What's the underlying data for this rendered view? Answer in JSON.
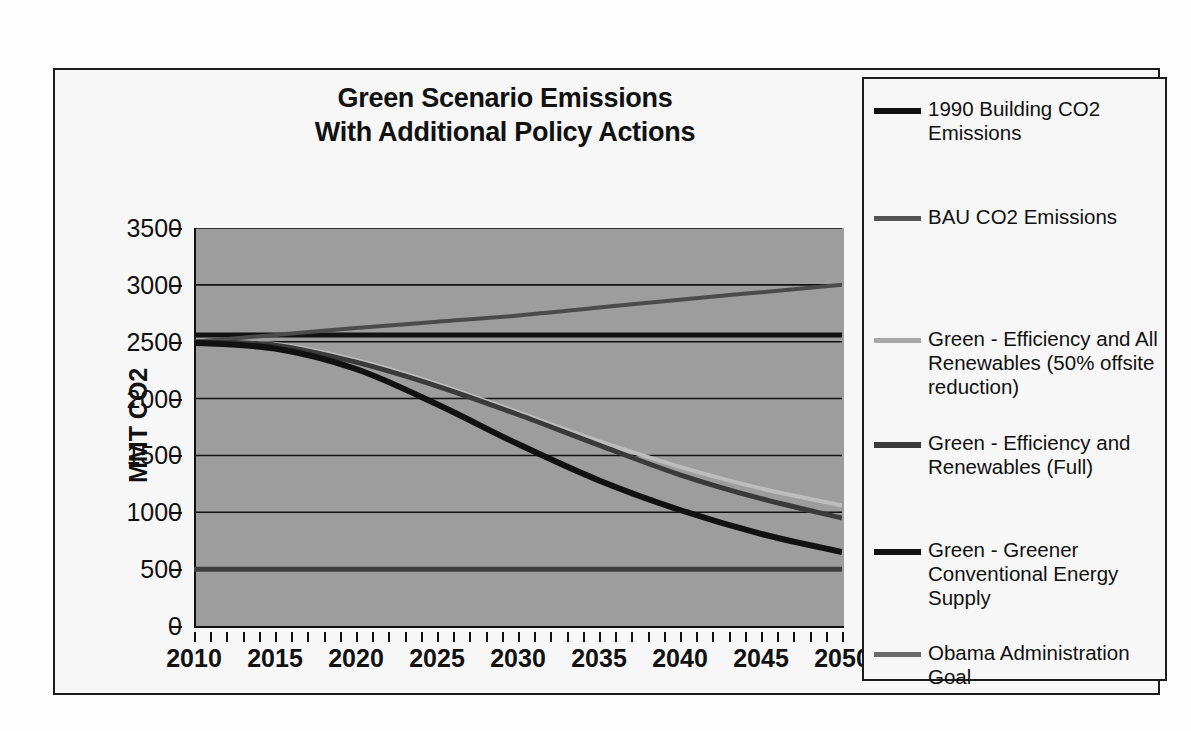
{
  "chart_data": {
    "type": "line",
    "title": "Green Scenario Emissions With Additional Policy Actions",
    "title_lines": [
      "Green Scenario Emissions",
      "With Additional Policy Actions"
    ],
    "xlabel": "",
    "ylabel": "MMT CO2",
    "xlim": [
      2010,
      2050
    ],
    "ylim": [
      0,
      3500
    ],
    "grid": true,
    "legend_position": "right",
    "y_ticks": [
      3500,
      3000,
      2500,
      2000,
      1500,
      1000,
      500,
      0
    ],
    "x_ticks": [
      2010,
      2015,
      2020,
      2025,
      2030,
      2035,
      2040,
      2045,
      2050
    ],
    "x_minor_step": 1,
    "plot_background": "#9d9d9d",
    "x": [
      2010,
      2015,
      2020,
      2025,
      2030,
      2035,
      2040,
      2045,
      2050
    ],
    "series": [
      {
        "name": "1990 Building CO2 Emissions",
        "color": "#111111",
        "width": 5,
        "values": [
          2560,
          2560,
          2560,
          2560,
          2560,
          2560,
          2560,
          2560,
          2560
        ]
      },
      {
        "name": "BAU CO2 Emissions",
        "color": "#4b4b4b",
        "width": 4,
        "values": [
          2500,
          2560,
          2620,
          2675,
          2730,
          2800,
          2870,
          2935,
          3000
        ]
      },
      {
        "name": "Green - Efficiency and All Renewables (50% offsite reduction)",
        "color": "#bdbdbd",
        "width": 4,
        "values": [
          2500,
          2480,
          2340,
          2130,
          1880,
          1625,
          1400,
          1210,
          1060
        ]
      },
      {
        "name": "Green - Efficiency and Renewables (Full)",
        "color": "#3a3a3a",
        "width": 5,
        "values": [
          2500,
          2470,
          2320,
          2110,
          1860,
          1590,
          1330,
          1120,
          950
        ]
      },
      {
        "name": "Green - Greener Conventional Energy Supply",
        "color": "#111111",
        "width": 6,
        "values": [
          2490,
          2440,
          2260,
          1950,
          1600,
          1280,
          1020,
          810,
          650
        ]
      },
      {
        "name": "Obama Administration Goal",
        "color": "#3f3f3f",
        "width": 5,
        "values": [
          500,
          500,
          500,
          500,
          500,
          500,
          500,
          500,
          500
        ]
      }
    ]
  },
  "legend": {
    "items": [
      {
        "label": "1990 Building CO2 Emissions",
        "color": "#111111",
        "thickness": 6,
        "top": 18
      },
      {
        "label": "BAU CO2 Emissions",
        "color": "#555555",
        "thickness": 5,
        "top": 126
      },
      {
        "label": "Green - Efficiency and All Renewables (50% offsite reduction)",
        "color": "#a8a8a8",
        "thickness": 5,
        "top": 248
      },
      {
        "label": "Green - Efficiency and Renewables (Full)",
        "color": "#3a3a3a",
        "thickness": 6,
        "top": 352
      },
      {
        "label": "Green - Greener Conventional Energy Supply",
        "color": "#111111",
        "thickness": 6,
        "top": 459
      },
      {
        "label": "Obama Administration Goal",
        "color": "#6a6a6a",
        "thickness": 5,
        "top": 562
      }
    ]
  }
}
